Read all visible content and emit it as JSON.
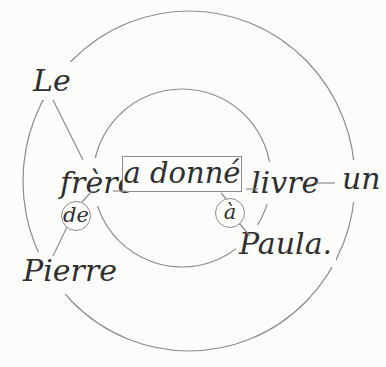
{
  "figure": {
    "type": "valency-dependency-diagram",
    "sentence": "Le frère de Pierre a donné à Paula un livre.",
    "palette": {
      "background": "#fcfcfa",
      "stroke": "#8d8d8d",
      "text": "#2f2f2f"
    },
    "words": {
      "le": "Le",
      "frere": "frère",
      "de": "de",
      "pierre": "Pierre",
      "verb": "a donné",
      "a": "à",
      "paula": "Paula.",
      "livre": "livre",
      "un": "un"
    }
  }
}
